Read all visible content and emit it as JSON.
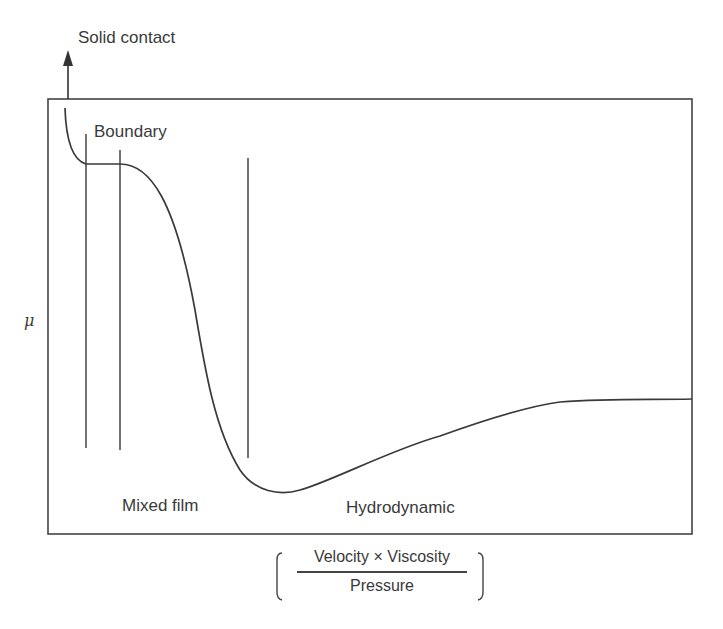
{
  "diagram": {
    "labels": {
      "solid_contact": "Solid contact",
      "boundary": "Boundary",
      "mixed_film": "Mixed film",
      "hydrodynamic": "Hydrodynamic",
      "y_axis": "μ"
    },
    "x_axis": {
      "numerator": "Velocity × Viscosity",
      "denominator": "Pressure"
    },
    "colors": {
      "line": "#3a3a3a",
      "background": "#ffffff"
    }
  }
}
